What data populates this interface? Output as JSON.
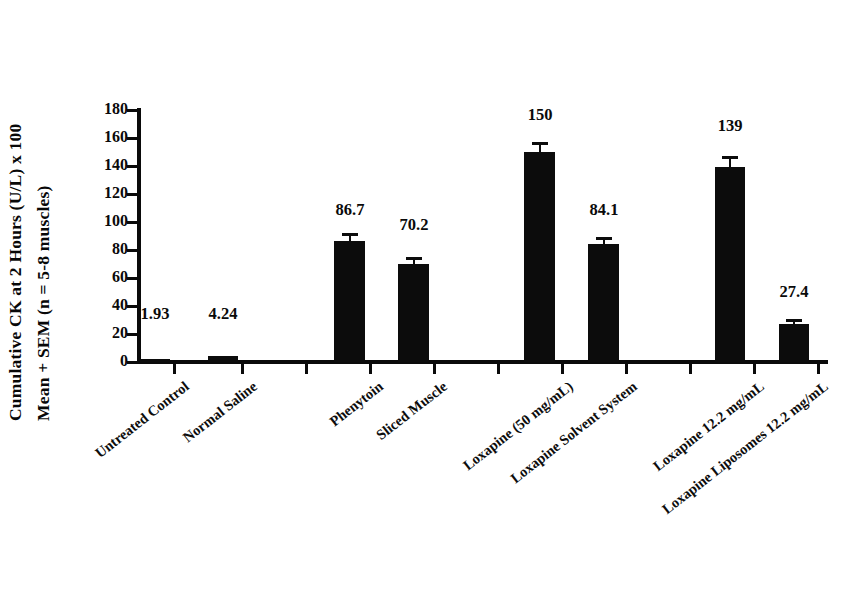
{
  "chart_data": {
    "type": "bar",
    "title": "",
    "subtitle": "",
    "xlabel": "",
    "ylabel_line1": "Cumulative CK at 2 Hours  (U/L) x 100",
    "ylabel_line2": "Mean + SEM (n = 5-8 muscles)",
    "ylim": [
      0,
      180
    ],
    "yticks": [
      0,
      20,
      40,
      60,
      80,
      100,
      120,
      140,
      160,
      180
    ],
    "ytick_labels": [
      "0",
      "20",
      "40",
      "60",
      "80",
      "100",
      "120",
      "140",
      "160",
      "180"
    ],
    "grid": false,
    "legend": null,
    "bar_color": "#0c0c0c",
    "axis_color": "#0a0a0a",
    "categories": [
      "Untreated Control",
      "Normal Saline",
      "Phenytoin",
      "Sliced Muscle",
      "Loxapine (50 mg/mL)",
      "Loxapine Solvent System",
      "Loxapine 12.2 mg/mL",
      "Loxapine Liposomes 12.2 mg/mL"
    ],
    "values": [
      1.93,
      4.24,
      86.7,
      70.2,
      150,
      84.1,
      139,
      27.4
    ],
    "value_labels": [
      "1.93",
      "4.24",
      "86.7",
      "70.2",
      "150",
      "84.1",
      "139",
      "27.4"
    ],
    "errors": [
      0,
      0,
      5.5,
      5.0,
      7.5,
      5.5,
      8.0,
      3.0
    ],
    "bars": [
      {
        "label": "Untreated Control",
        "value": 1.93,
        "value_label": "1.93",
        "error": 0.0,
        "x": 140,
        "width": 30,
        "label_x": 155,
        "label_y": 304
      },
      {
        "label": "Normal Saline",
        "value": 4.24,
        "value_label": "4.24",
        "error": 0.0,
        "x": 208,
        "width": 30,
        "label_x": 223,
        "label_y": 304
      },
      {
        "label": "Phenytoin",
        "value": 86.7,
        "value_label": "86.7",
        "error": 5.5,
        "x": 334,
        "width": 31,
        "label_x": 350,
        "label_y": 200
      },
      {
        "label": "Sliced Muscle",
        "value": 70.2,
        "value_label": "70.2",
        "error": 5.0,
        "x": 398,
        "width": 31,
        "label_x": 414,
        "label_y": 215
      },
      {
        "label": "Loxapine (50 mg/mL)",
        "value": 150,
        "value_label": "150",
        "error": 7.5,
        "x": 524,
        "width": 31,
        "label_x": 540,
        "label_y": 105
      },
      {
        "label": "Loxapine Solvent System",
        "value": 84.1,
        "value_label": "84.1",
        "error": 5.5,
        "x": 588,
        "width": 31,
        "label_x": 604,
        "label_y": 200
      },
      {
        "label": "Loxapine 12.2 mg/mL",
        "value": 139,
        "value_label": "139",
        "error": 8.0,
        "x": 715,
        "width": 30,
        "label_x": 730,
        "label_y": 116
      },
      {
        "label": "Loxapine Liposomes 12.2 mg/mL",
        "value": 27.4,
        "value_label": "27.4",
        "error": 3.0,
        "x": 779,
        "width": 30,
        "label_x": 794,
        "label_y": 282
      }
    ],
    "xtick_positions": [
      173,
      241,
      305,
      369,
      433,
      497,
      561,
      625,
      689,
      753,
      817
    ],
    "category_label_anchors": [
      {
        "label": "Untreated Control",
        "x": 182,
        "y": 378
      },
      {
        "label": "Normal Saline",
        "x": 250,
        "y": 378
      },
      {
        "label": "Phenytoin",
        "x": 376,
        "y": 378
      },
      {
        "label": "Sliced Muscle",
        "x": 440,
        "y": 378
      },
      {
        "label": "Loxapine (50 mg/mL)",
        "x": 566,
        "y": 378
      },
      {
        "label": "Loxapine Solvent System",
        "x": 630,
        "y": 378
      },
      {
        "label": "Loxapine 12.2 mg/mL",
        "x": 757,
        "y": 378
      },
      {
        "label": "Loxapine Liposomes 12.2 mg/mL",
        "x": 821,
        "y": 378
      }
    ]
  }
}
